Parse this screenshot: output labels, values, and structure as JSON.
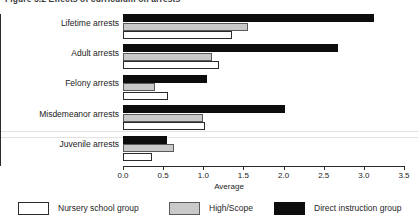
{
  "figure": {
    "title": "Figure 5.2 Effects of curriculum on arrests"
  },
  "chart_data": {
    "type": "bar",
    "orientation": "horizontal",
    "title": "Figure 5.2 Effects of curriculum on arrests",
    "xlabel": "Average",
    "ylabel": "",
    "xlim": [
      0.0,
      3.5
    ],
    "xticks": [
      "0.0",
      "0.5",
      "1.0",
      "1.5",
      "2.0",
      "2.5",
      "3.0",
      "3.5"
    ],
    "xtick_values": [
      0.0,
      0.5,
      1.0,
      1.5,
      2.0,
      2.5,
      3.0,
      3.5
    ],
    "grid": false,
    "legend_position": "bottom",
    "categories": [
      "Lifetime arrests",
      "Adult arrests",
      "Felony arrests",
      "Misdemeanor arrests",
      "Juvenile arrests"
    ],
    "series": [
      {
        "name": "Nursery school group",
        "color": "#ffffff",
        "values": [
          1.36,
          1.2,
          0.56,
          1.02,
          0.36
        ]
      },
      {
        "name": "High/Scope",
        "color": "#c9c9c9",
        "values": [
          1.56,
          1.11,
          0.4,
          1.0,
          0.64
        ]
      },
      {
        "name": "Direct instruction group",
        "color": "#0d0d0d",
        "values": [
          3.13,
          2.68,
          1.05,
          2.02,
          0.55
        ]
      }
    ]
  },
  "legend": {
    "items": [
      {
        "label": "Nursery school group",
        "swatch": "white"
      },
      {
        "label": "High/Scope",
        "swatch": "gray"
      },
      {
        "label": "Direct instruction group",
        "swatch": "black"
      }
    ]
  },
  "axis": {
    "x_title": "Average"
  }
}
